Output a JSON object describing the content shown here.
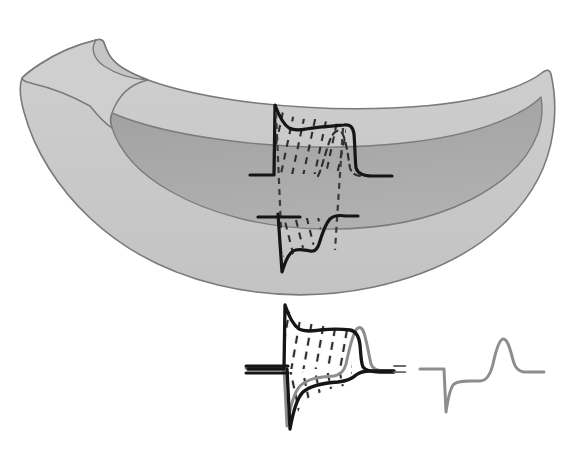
{
  "figure": {
    "caption": "",
    "background_color": "#ffffff",
    "equals_label": "="
  },
  "anatomy": {
    "name": "ventricular-wall-wedge",
    "description": "Cut-away bowl-shaped ventricular wall wedge viewed obliquely",
    "outer_wall_color": "#c9c9c9",
    "inner_cavity_color": "#a5a5a5",
    "outline_color": "#7a7a7a",
    "outline_width": 1.6,
    "layers": [
      {
        "label": "epicardium",
        "position": "outer-top"
      },
      {
        "label": "endocardium",
        "position": "inner-cavity"
      }
    ]
  },
  "traces": {
    "stroke_color": "#151515",
    "stroke_width": 3.2,
    "ecg_color": "#8d8d8d",
    "ecg_stroke_width": 3.0,
    "gradient_hatch_color": "#2b2b2b",
    "gradient_hatch_dash": "5 5",
    "projection_line_color": "#3a3a3a",
    "projection_line_dash": "6 5",
    "items": [
      {
        "name": "epicardial-action-potential",
        "label": "Epicardial AP",
        "morphology": "spike-and-dome with prominent phase-1 notch",
        "polarity": "upward",
        "baseline_y": 175,
        "peak_y": 104,
        "upstroke_x": 274,
        "repolarization_x": 352
      },
      {
        "name": "endocardial-action-potential",
        "label": "Endocardial AP",
        "morphology": "no notch, longer plateau, drawn inverted",
        "polarity": "downward",
        "baseline_y": 216,
        "peak_y": 272,
        "upstroke_x": 278,
        "repolarization_x": 333
      },
      {
        "name": "composite-action-potentials",
        "label": "Superimposed epicardial and endocardial action potentials",
        "polarity": "mirrored pair",
        "baseline_y": 369,
        "upper_peak_y": 307,
        "lower_peak_y": 428
      },
      {
        "name": "ecg-trace",
        "label": "ECG",
        "waves": [
          "QRS",
          "T"
        ],
        "qrs_polarity": "negative",
        "t_wave_polarity": "positive",
        "baseline_y": 369,
        "qrs_x": 445,
        "qrs_trough_y": 412,
        "t_peak_x": 495,
        "t_peak_y": 338
      }
    ]
  },
  "annotations": {
    "projection_lines": [
      {
        "name": "left-projection-line",
        "from": "epicardial upstroke",
        "to": "endocardial upstroke"
      },
      {
        "name": "right-projection-line",
        "from": "epicardial repolarization",
        "to": "endocardial repolarization"
      }
    ],
    "hatching_regions": [
      {
        "name": "upper-voltage-gradient-hatch",
        "meaning": "transmural voltage gradient during plateau"
      },
      {
        "name": "lower-voltage-gradient-hatch",
        "meaning": "transmural voltage gradient, endocardial side"
      },
      {
        "name": "composite-upper-hatch",
        "meaning": "area under epicardial trace"
      },
      {
        "name": "composite-lower-hatch",
        "meaning": "area under endocardial trace"
      }
    ]
  }
}
